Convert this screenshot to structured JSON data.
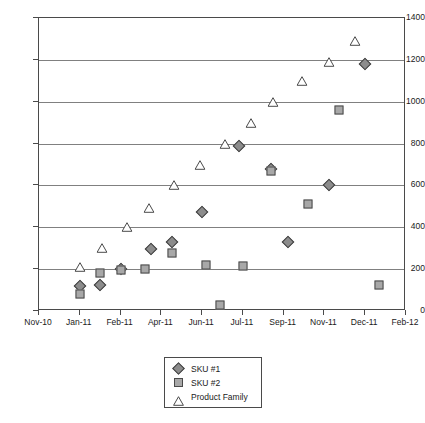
{
  "chart_data": {
    "type": "scatter",
    "title": "",
    "subtitle": "",
    "xlabel": "",
    "ylabel": "",
    "grid": true,
    "legend_position": "bottom-center",
    "ylim": [
      0,
      1400
    ],
    "y_ticks": [
      0,
      200,
      400,
      600,
      800,
      1000,
      1200,
      1400
    ],
    "x_ticks": [
      "Nov-10",
      "Jan-11",
      "Feb-11",
      "Apr-11",
      "Jun-11",
      "Jul-11",
      "Sep-11",
      "Nov-11",
      "Dec-11",
      "Feb-12"
    ],
    "xlim_index": [
      0,
      9
    ],
    "series": [
      {
        "name": "SKU #1",
        "marker": "diamond",
        "color": "#8c8c8c",
        "edge_color": "#3d3d3d",
        "points": [
          {
            "x": 1.0,
            "y": 120
          },
          {
            "x": 1.5,
            "y": 125
          },
          {
            "x": 2.0,
            "y": 200
          },
          {
            "x": 2.75,
            "y": 295
          },
          {
            "x": 3.25,
            "y": 330
          },
          {
            "x": 4.0,
            "y": 475
          },
          {
            "x": 4.9,
            "y": 790
          },
          {
            "x": 5.7,
            "y": 680
          },
          {
            "x": 6.1,
            "y": 330
          },
          {
            "x": 7.1,
            "y": 600
          },
          {
            "x": 8.0,
            "y": 1180
          }
        ]
      },
      {
        "name": "SKU #2",
        "marker": "square",
        "color": "#a8a8a8",
        "edge_color": "#4a4a4a",
        "points": [
          {
            "x": 1.0,
            "y": 80
          },
          {
            "x": 1.5,
            "y": 180
          },
          {
            "x": 2.0,
            "y": 195
          },
          {
            "x": 2.6,
            "y": 200
          },
          {
            "x": 3.25,
            "y": 275
          },
          {
            "x": 4.1,
            "y": 220
          },
          {
            "x": 4.45,
            "y": 30
          },
          {
            "x": 5.0,
            "y": 215
          },
          {
            "x": 5.7,
            "y": 670
          },
          {
            "x": 6.6,
            "y": 510
          },
          {
            "x": 7.35,
            "y": 960
          },
          {
            "x": 8.35,
            "y": 125
          }
        ]
      },
      {
        "name": "Product Family",
        "marker": "triangle",
        "color": "#ffffff",
        "edge_color": "#4a4a4a",
        "points": [
          {
            "x": 1.0,
            "y": 210
          },
          {
            "x": 1.55,
            "y": 300
          },
          {
            "x": 2.15,
            "y": 400
          },
          {
            "x": 2.7,
            "y": 490
          },
          {
            "x": 3.3,
            "y": 600
          },
          {
            "x": 3.95,
            "y": 700
          },
          {
            "x": 4.55,
            "y": 800
          },
          {
            "x": 5.2,
            "y": 900
          },
          {
            "x": 5.75,
            "y": 1000
          },
          {
            "x": 6.45,
            "y": 1100
          },
          {
            "x": 7.1,
            "y": 1190
          },
          {
            "x": 7.75,
            "y": 1290
          }
        ]
      }
    ]
  },
  "legend": {
    "items": [
      {
        "label": "SKU #1",
        "marker": "diamond"
      },
      {
        "label": "SKU #2",
        "marker": "square"
      },
      {
        "label": "Product Family",
        "marker": "triangle"
      }
    ]
  }
}
